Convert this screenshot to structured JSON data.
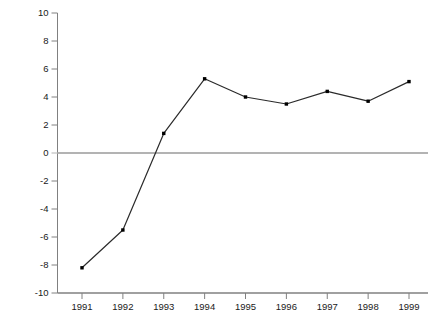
{
  "chart_data": {
    "type": "line",
    "title": "",
    "xlabel": "",
    "ylabel": "Percent",
    "x": [
      1991,
      1992,
      1993,
      1994,
      1995,
      1996,
      1997,
      1998,
      1999
    ],
    "xtick_labels": [
      "1991",
      "1992",
      "1993",
      "1994",
      "1995",
      "1996",
      "1997",
      "1998",
      "1999"
    ],
    "values": [
      -8.2,
      -5.5,
      1.4,
      5.3,
      4.0,
      3.5,
      4.4,
      3.7,
      5.1
    ],
    "series": [
      {
        "name": "Percent",
        "values": [
          -8.2,
          -5.5,
          1.4,
          5.3,
          4.0,
          3.5,
          4.4,
          3.7,
          5.1
        ]
      }
    ],
    "ylim": [
      -10,
      10
    ],
    "yticks": [
      10,
      8,
      6,
      4,
      2,
      0,
      -2,
      -4,
      -6,
      -8,
      -10
    ],
    "ytick_labels": [
      "10",
      "8",
      "6",
      "4",
      "2",
      "0",
      "-2",
      "-4",
      "-6",
      "-8",
      "-10"
    ],
    "xlim": [
      1990.6,
      1999.4
    ],
    "grid": false,
    "legend": false,
    "legend_position": "none",
    "marker": "square",
    "colors": {
      "line": "#2b2b2b",
      "marker": "#000000",
      "axis": "#808080",
      "zero_line": "#b3b3b3",
      "text": "#1a1a1a",
      "background": "#ffffff"
    }
  }
}
